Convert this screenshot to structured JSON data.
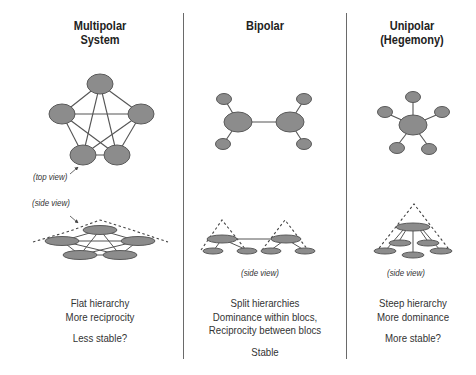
{
  "columns": [
    {
      "id": "multipolar",
      "title_lines": [
        "Multipolar",
        "System"
      ],
      "annotations": {
        "top_view": "(top view)",
        "side_view": "(side view)"
      },
      "description": [
        "Flat hierarchy",
        "More reciprocity"
      ],
      "stability": "Less stable?"
    },
    {
      "id": "bipolar",
      "title_lines": [
        "Bipolar"
      ],
      "annotations": {
        "side_view": "(side view)"
      },
      "description": [
        "Split hierarchies",
        "Dominance within blocs,",
        "Reciprocity between blocs"
      ],
      "stability": "Stable"
    },
    {
      "id": "unipolar",
      "title_lines": [
        "Unipolar",
        "(Hegemony)"
      ],
      "annotations": {
        "side_view": "(side view)"
      },
      "description": [
        "Steep hierarchy",
        "More dominance"
      ],
      "stability": "More stable?"
    }
  ],
  "colors": {
    "node_fill": "#8c8c8c",
    "node_stroke": "#5a5a5a",
    "edge": "#555555",
    "dashed": "#444444",
    "divider": "#6a6a6a"
  }
}
